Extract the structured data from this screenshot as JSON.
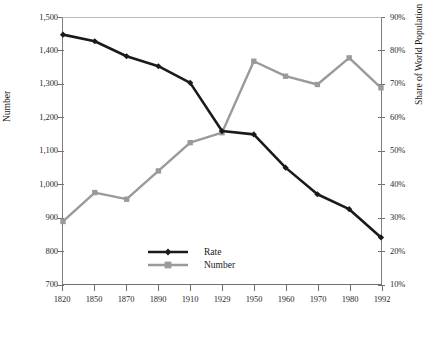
{
  "chart_data": {
    "type": "line",
    "title": "",
    "subtitle": "",
    "xlabel": "",
    "ylabel": "Number",
    "y2label": "Share of World Population",
    "grid": false,
    "legend_position": "inside-bottom-center",
    "categories": [
      "1820",
      "1850",
      "1870",
      "1890",
      "1910",
      "1929",
      "1950",
      "1960",
      "1970",
      "1980",
      "1992"
    ],
    "x_tick_labels": [
      "1820",
      "1850",
      "1870",
      "1890",
      "1910",
      "1929",
      "1950",
      "1960",
      "1970",
      "1980",
      "1992"
    ],
    "ylim": [
      700,
      1500
    ],
    "y_tick_labels": [
      "700",
      "800",
      "900",
      "1,000",
      "1,100",
      "1,200",
      "1,300",
      "1,400",
      "1,500"
    ],
    "y_ticks": [
      700,
      800,
      900,
      1000,
      1100,
      1200,
      1300,
      1400,
      1500
    ],
    "y2lim": [
      10,
      90
    ],
    "y2_tick_labels": [
      "10%",
      "20%",
      "30%",
      "40%",
      "50%",
      "60%",
      "70%",
      "80%",
      "90%"
    ],
    "y2_ticks": [
      10,
      20,
      30,
      40,
      50,
      60,
      70,
      80,
      90
    ],
    "series": [
      {
        "name": "Rate",
        "axis": "right",
        "color": "#1a1a1a",
        "marker": "diamond",
        "values": [
          85.0,
          83.0,
          78.5,
          75.5,
          70.5,
          56.0,
          55.0,
          45.0,
          37.0,
          32.5,
          24.0
        ]
      },
      {
        "name": "Number",
        "axis": "left",
        "color": "#9a9a9a",
        "marker": "square",
        "values": [
          888,
          975,
          955,
          1040,
          1125,
          1155,
          1370,
          1325,
          1300,
          1380,
          1290
        ]
      }
    ],
    "legend": [
      {
        "label": "Rate",
        "color": "#1a1a1a"
      },
      {
        "label": "Number",
        "color": "#9a9a9a"
      }
    ]
  }
}
